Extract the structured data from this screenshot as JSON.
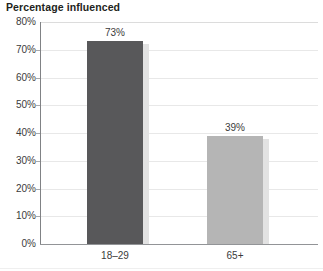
{
  "chart_data": {
    "type": "bar",
    "title": "Percentage influenced",
    "xlabel": "",
    "ylabel": "",
    "categories": [
      "18–29",
      "65+"
    ],
    "values": [
      73,
      39
    ],
    "value_labels": [
      "73%",
      "39%"
    ],
    "ylim": [
      0,
      80
    ],
    "ytick_values": [
      80,
      70,
      60,
      50,
      40,
      30,
      20,
      10,
      0
    ],
    "ytick_labels": [
      "80%",
      "70%",
      "60%",
      "50%",
      "40%",
      "30%",
      "20%",
      "10%",
      "0%"
    ],
    "grid": true,
    "legend": false,
    "series": [
      {
        "name": "Percentage influenced",
        "values": [
          73,
          39
        ],
        "bar_colors": [
          "#58585a",
          "#b5b5b5"
        ]
      }
    ]
  },
  "colors": {
    "bar_dark": "#58585a",
    "bar_light": "#b5b5b5",
    "bar_shadow": "#e2e2e2",
    "gridline": "#e8e8e8",
    "axis": "#808285",
    "text": "#3b3b3b",
    "title_text": "#231f20",
    "background": "#ffffff"
  }
}
